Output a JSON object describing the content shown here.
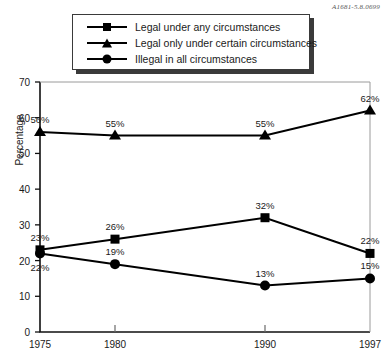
{
  "source_code": "A1681-5.8.0699",
  "legend": {
    "position": "top-center",
    "items": [
      {
        "label": "Legal under any circumstances",
        "marker": "square-marker"
      },
      {
        "label": "Legal only under certain circumstances",
        "marker": "triangle-marker"
      },
      {
        "label": "Illegal in all circumstances",
        "marker": "circle-marker"
      }
    ]
  },
  "chart_data": {
    "type": "line",
    "title": "",
    "subtitle": "",
    "xlabel": "",
    "ylabel": "Percentage",
    "x": [
      1975,
      1980,
      1990,
      1997
    ],
    "categories": [
      "1975",
      "1980",
      "1990",
      "1997"
    ],
    "xlim": [
      1975,
      1997
    ],
    "ylim": [
      0,
      70
    ],
    "yticks": [
      0,
      10,
      20,
      30,
      40,
      50,
      60,
      70
    ],
    "ytick_labels": [
      "0",
      "10",
      "20",
      "30",
      "40",
      "50",
      "60",
      "70"
    ],
    "xtick_labels": [
      "1975",
      "1980",
      "1990",
      "1997"
    ],
    "grid": false,
    "legend_position": "top-center",
    "series": [
      {
        "name": "Legal under any circumstances",
        "marker": "square",
        "color": "#000000",
        "values": [
          23,
          26,
          32,
          22
        ],
        "data_labels": [
          "23%",
          "26%",
          "32%",
          "22%"
        ]
      },
      {
        "name": "Legal only under certain circumstances",
        "marker": "triangle",
        "color": "#000000",
        "values": [
          56,
          55,
          55,
          62
        ],
        "data_labels": [
          "56%",
          "55%",
          "55%",
          "62%"
        ]
      },
      {
        "name": "Illegal in all circumstances",
        "marker": "circle",
        "color": "#000000",
        "values": [
          22,
          19,
          13,
          15
        ],
        "data_labels": [
          "22%",
          "19%",
          "13%",
          "15%"
        ]
      }
    ]
  }
}
